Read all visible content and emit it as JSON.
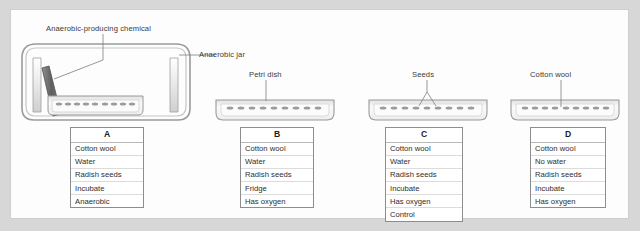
{
  "figure": {
    "background": "#d7d7d7",
    "panel_background": "#fdfdfd"
  },
  "labels": {
    "chemical": "Anaerobic-producing chemical",
    "jar": "Anaerobic jar",
    "petri_dish": "Petri dish",
    "seeds": "Seeds",
    "cotton_wool": "Cotton wool"
  },
  "cards": [
    {
      "id": "A",
      "header": "A",
      "items": [
        "Cotton wool",
        "Water",
        "Radish seeds",
        "Incubate",
        "Anaerobic"
      ]
    },
    {
      "id": "B",
      "header": "B",
      "items": [
        "Cotton wool",
        "Water",
        "Radish seeds",
        "Fridge",
        "Has oxygen"
      ]
    },
    {
      "id": "C",
      "header": "C",
      "items": [
        "Cotton wool",
        "Water",
        "Radish seeds",
        "Incubate",
        "Has oxygen",
        "Control"
      ]
    },
    {
      "id": "D",
      "header": "D",
      "items": [
        "Cotton wool",
        "No water",
        "Radish seeds",
        "Incubate",
        "Has oxygen"
      ]
    }
  ],
  "colors": {
    "line": "#8d8d8d",
    "dish_fill": "#f2f2f2",
    "sachet": "#6f6f6f",
    "text": "#3a3a3a"
  }
}
